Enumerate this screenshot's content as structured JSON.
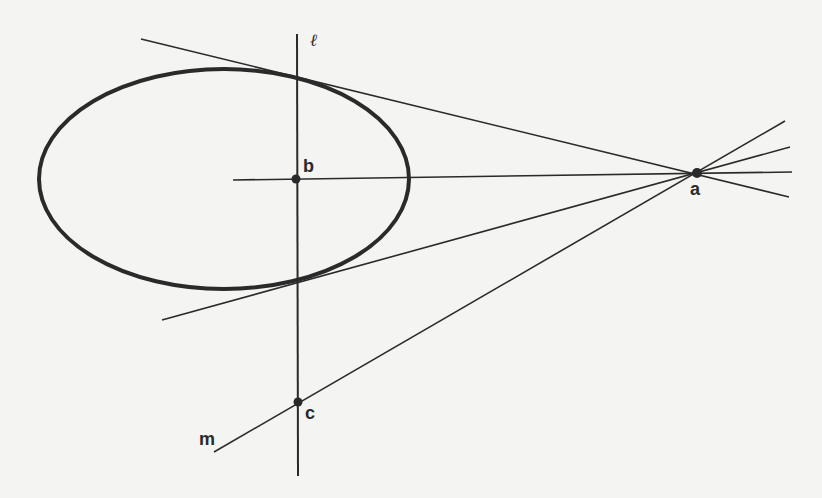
{
  "diagram": {
    "colors": {
      "background": "#f4f4f2",
      "ink": "#2a2a2a"
    },
    "ellipse": {
      "cx": 224,
      "cy": 179,
      "rx": 185,
      "ry": 110,
      "stroke_width": 4
    },
    "points": {
      "a": {
        "label": "a",
        "x": 697,
        "y": 173
      },
      "b": {
        "label": "b",
        "x": 296,
        "y": 179
      },
      "c": {
        "label": "c",
        "x": 298,
        "y": 402
      }
    },
    "lines": {
      "l": {
        "label": "ℓ",
        "x1": 297,
        "y1": 34,
        "x2": 298,
        "y2": 476
      },
      "m": {
        "label": "m",
        "x1": 214,
        "y1": 452,
        "x2": 785,
        "y2": 121
      },
      "upper_tangent": {
        "x1": 141,
        "y1": 39,
        "x2": 789,
        "y2": 197
      },
      "lower_tangent": {
        "x1": 162,
        "y1": 320,
        "x2": 790,
        "y2": 147
      },
      "horizontal_ab": {
        "x1": 233,
        "y1": 180,
        "x2": 792,
        "y2": 172
      }
    },
    "labels": {
      "l": "ℓ",
      "m": "m",
      "a": "a",
      "b": "b",
      "c": "c"
    }
  }
}
